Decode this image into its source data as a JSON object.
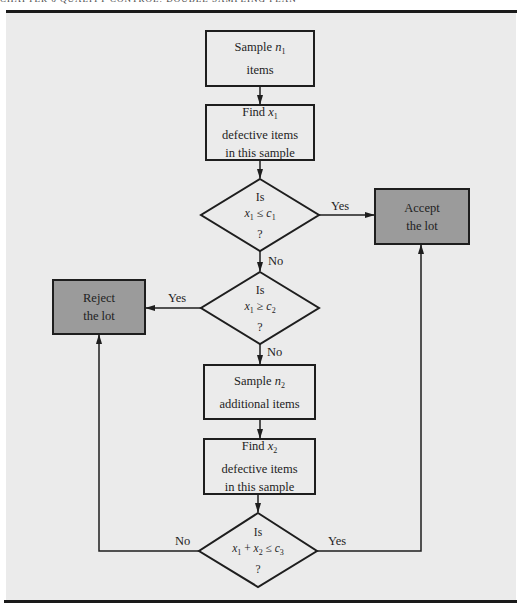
{
  "header": {
    "running_text": "CHAPTER 6   QUALITY CONTROL: DOUBLE SAMPLING PLAN"
  },
  "colors": {
    "panel_background": "#ebebeb",
    "terminal_fill": "#9b9b9b",
    "process_fill": "#ebebeb",
    "stroke": "#1e1e1e"
  },
  "flowchart": {
    "nodes": {
      "sample_n1": {
        "line1_prefix": "Sample ",
        "var": "n",
        "sub": "1",
        "line2": "items"
      },
      "find_x1": {
        "line1_prefix": "Find ",
        "var": "x",
        "sub": "1",
        "line2": "defective items",
        "line3": "in this sample"
      },
      "decision1": {
        "line1": "Is",
        "var1": "x",
        "sub1": "1",
        "op": " ≤ ",
        "var2": "c",
        "sub2": "1",
        "line3": "?"
      },
      "accept": {
        "line1": "Accept",
        "line2": "the lot"
      },
      "decision2": {
        "line1": "Is",
        "var1": "x",
        "sub1": "1",
        "op": " ≥ ",
        "var2": "c",
        "sub2": "2",
        "line3": "?"
      },
      "reject": {
        "line1": "Reject",
        "line2": "the lot"
      },
      "sample_n2": {
        "line1_prefix": "Sample ",
        "var": "n",
        "sub": "2",
        "line2": "additional items"
      },
      "find_x2": {
        "line1_prefix": "Find ",
        "var": "x",
        "sub": "2",
        "line2": "defective items",
        "line3": "in this sample"
      },
      "decision3": {
        "line1": "Is",
        "var1": "x",
        "sub1": "1",
        "plus": " + ",
        "var2": "x",
        "sub2": "2",
        "op": " ≤ ",
        "var3": "c",
        "sub3": "3",
        "line3": "?"
      }
    },
    "edge_labels": {
      "d1_yes": "Yes",
      "d1_no": "No",
      "d2_yes": "Yes",
      "d2_no": "No",
      "d3_no": "No",
      "d3_yes": "Yes"
    }
  }
}
